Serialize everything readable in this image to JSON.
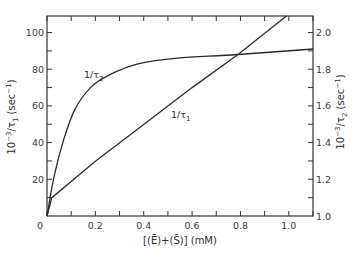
{
  "chart_data": {
    "type": "line",
    "title": "",
    "xlabel": "[(Ē)+(S̄)]  (mM)",
    "ylabel_left": "10⁻³/τ₁ (sec⁻¹)",
    "ylabel_right": "10⁻³/τ₂ (sec⁻¹)",
    "xlim": [
      0,
      1.1
    ],
    "ylim_left": [
      0,
      109
    ],
    "ylim_right": [
      1.0,
      2.09
    ],
    "grid": false,
    "legend": "inline curve labels",
    "x_ticks": [
      0,
      0.1,
      0.2,
      0.3,
      0.4,
      0.5,
      0.6,
      0.7,
      0.8,
      0.9,
      1.0,
      1.1
    ],
    "x_tick_labels": [
      {
        "value": 0,
        "label": "0"
      },
      {
        "value": 0.2,
        "label": "0.2"
      },
      {
        "value": 0.4,
        "label": "0.4"
      },
      {
        "value": 0.6,
        "label": "0.6"
      },
      {
        "value": 0.8,
        "label": "0.8"
      },
      {
        "value": 1.0,
        "label": "1.0"
      }
    ],
    "y_left_ticks": [
      0,
      10,
      20,
      30,
      40,
      50,
      60,
      70,
      80,
      90,
      100
    ],
    "y_left_tick_labels": [
      {
        "value": 20,
        "label": "20"
      },
      {
        "value": 40,
        "label": "40"
      },
      {
        "value": 60,
        "label": "60"
      },
      {
        "value": 80,
        "label": "80"
      },
      {
        "value": 100,
        "label": "100"
      }
    ],
    "y_right_ticks": [
      1.0,
      1.1,
      1.2,
      1.3,
      1.4,
      1.5,
      1.6,
      1.7,
      1.8,
      1.9,
      2.0
    ],
    "y_right_tick_labels": [
      {
        "value": 1.0,
        "label": "1.0"
      },
      {
        "value": 1.2,
        "label": "1.2"
      },
      {
        "value": 1.4,
        "label": "1.4"
      },
      {
        "value": 1.6,
        "label": "1.6"
      },
      {
        "value": 1.8,
        "label": "1.8"
      },
      {
        "value": 2.0,
        "label": "2.0"
      }
    ],
    "series": [
      {
        "name": "1/τ₁",
        "label": "1/τ",
        "label_sub": "1",
        "axis": "left",
        "shape": "linear",
        "x": [
          0.0,
          0.02,
          0.2,
          0.4,
          0.6,
          0.79,
          0.99
        ],
        "y": [
          0,
          10,
          29.8,
          49.9,
          70.0,
          88.0,
          109
        ]
      },
      {
        "name": "1/τ₂",
        "label": "1/τ",
        "label_sub": "2",
        "axis": "right",
        "shape": "hyperbolic",
        "x": [
          0.0,
          0.03,
          0.07,
          0.115,
          0.18,
          0.26,
          0.38,
          0.54,
          0.79,
          1.1
        ],
        "y": [
          1.0,
          1.22,
          1.42,
          1.58,
          1.7,
          1.77,
          1.83,
          1.86,
          1.88,
          1.91
        ]
      }
    ],
    "annotations": [
      {
        "text": "1/τ₂",
        "x": 0.18,
        "y_left": 77
      },
      {
        "text": "1/τ₁",
        "x": 0.53,
        "y_left": 53
      }
    ]
  },
  "labels": {
    "x_axis": "[(Ē)+(S̄)]  (mM)",
    "y_left_main": "10",
    "y_left_exp": "−3",
    "y_left_rest": "/τ",
    "y_left_sub": "1",
    "y_left_unit": " (sec",
    "y_left_unit_exp": "−1",
    "y_left_unit_close": ")",
    "y_right_main": "10",
    "y_right_exp": "−3",
    "y_right_rest": "/τ",
    "y_right_sub": "2",
    "y_right_unit": " (sec",
    "y_right_unit_exp": "−1",
    "y_right_unit_close": ")",
    "tau1_main": "1/τ",
    "tau1_sub": "1",
    "tau2_main": "1/τ",
    "tau2_sub": "2"
  }
}
